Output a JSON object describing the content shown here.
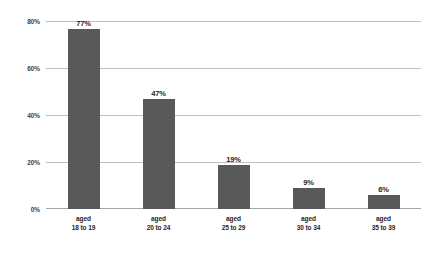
{
  "chart_data": {
    "type": "bar",
    "title": "",
    "subtitle": "",
    "xlabel": "",
    "ylabel": "",
    "categories": [
      "aged 18 to 19",
      "aged 20 to 24",
      "aged 25 to 29",
      "aged 30 to 34",
      "aged 35 to 39"
    ],
    "category_lines": [
      [
        "aged",
        "18 to 19"
      ],
      [
        "aged",
        "20 to 24"
      ],
      [
        "aged",
        "25 to 29"
      ],
      [
        "aged",
        "30 to 34"
      ],
      [
        "aged",
        "35 to 39"
      ]
    ],
    "values": [
      77,
      47,
      19,
      9,
      6
    ],
    "data_labels": [
      "77%",
      "47%",
      "19%",
      "9%",
      "6%"
    ],
    "ylim": [
      0,
      80
    ],
    "yticks": [
      0,
      20,
      40,
      60,
      80
    ],
    "ytick_labels": [
      "0%",
      "20%",
      "40%",
      "60%",
      "80%"
    ],
    "grid": true,
    "grid_axis": "y",
    "legend": false,
    "legend_position": "none",
    "bar_color": "#595959",
    "gridline_color": "#bfbfbf",
    "axis_color": "#a6a6a6",
    "background_color": "#ffffff",
    "label_color": "#262626"
  }
}
